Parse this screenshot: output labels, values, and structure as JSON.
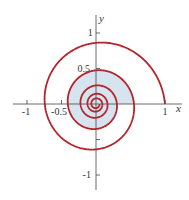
{
  "figure": {
    "colors": {
      "curve": "#b5252b",
      "fill": "#d6e4f0",
      "axis": "#444444"
    }
  },
  "axes": {
    "x_label": "x",
    "y_label": "y",
    "x_ticks": [
      {
        "value": -1,
        "label": "-1"
      },
      {
        "value": -0.5,
        "label": "-0.5"
      },
      {
        "value": 1,
        "label": "1"
      }
    ],
    "y_ticks": [
      {
        "value": 1,
        "label": "1"
      },
      {
        "value": 0.5,
        "label": "0.5"
      },
      {
        "value": -0.5,
        "label": ""
      },
      {
        "value": -1,
        "label": "-1"
      }
    ]
  },
  "curve": {
    "equation": "r = e^(-0.095 θ)",
    "a": 0.095,
    "theta_max_turns": 5,
    "shaded_turn_start": 1,
    "shaded_turn_end": 2
  }
}
